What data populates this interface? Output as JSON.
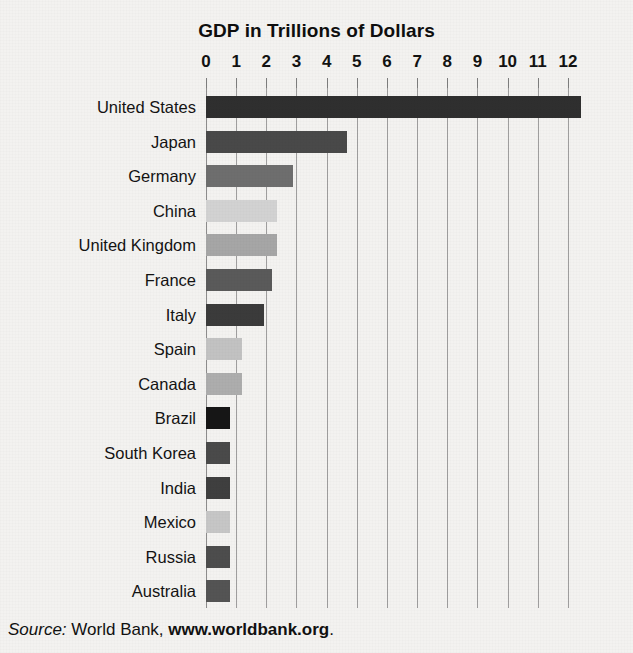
{
  "chart_data": {
    "type": "bar",
    "orientation": "horizontal",
    "title": "GDP in Trillions of Dollars",
    "xlabel": "",
    "ylabel": "",
    "xlim": [
      0,
      12.5
    ],
    "grid": true,
    "legend": null,
    "xticks": [
      "0",
      "1",
      "2",
      "3",
      "4",
      "5",
      "6",
      "7",
      "8",
      "9",
      "10",
      "11",
      "12"
    ],
    "xtick_values": [
      0,
      1,
      2,
      3,
      4,
      5,
      6,
      7,
      8,
      9,
      10,
      11,
      12
    ],
    "categories": [
      "United States",
      "Japan",
      "Germany",
      "China",
      "United Kingdom",
      "France",
      "Italy",
      "Spain",
      "Canada",
      "Brazil",
      "South Korea",
      "India",
      "Mexico",
      "Russia",
      "Australia"
    ],
    "values": [
      12.45,
      4.67,
      2.88,
      2.35,
      2.35,
      2.2,
      1.92,
      1.2,
      1.2,
      0.8,
      0.8,
      0.8,
      0.8,
      0.8,
      0.8
    ],
    "bar_colors": [
      "#2f2f2f",
      "#494949",
      "#6e6e6e",
      "#d2d2d2",
      "#a6a6a6",
      "#5a5a5a",
      "#3b3b3b",
      "#c2c2c2",
      "#adadad",
      "#161616",
      "#4a4a4a",
      "#3f3f3f",
      "#c6c6c6",
      "#4d4d4d",
      "#545454"
    ]
  },
  "source": {
    "lead": "Source:",
    "body": " World Bank, ",
    "link": "www.worldbank.org",
    "tail": "."
  },
  "colors": {
    "background": "#f3f2f0",
    "text": "#121212",
    "gridline": "#8f8f8f"
  }
}
